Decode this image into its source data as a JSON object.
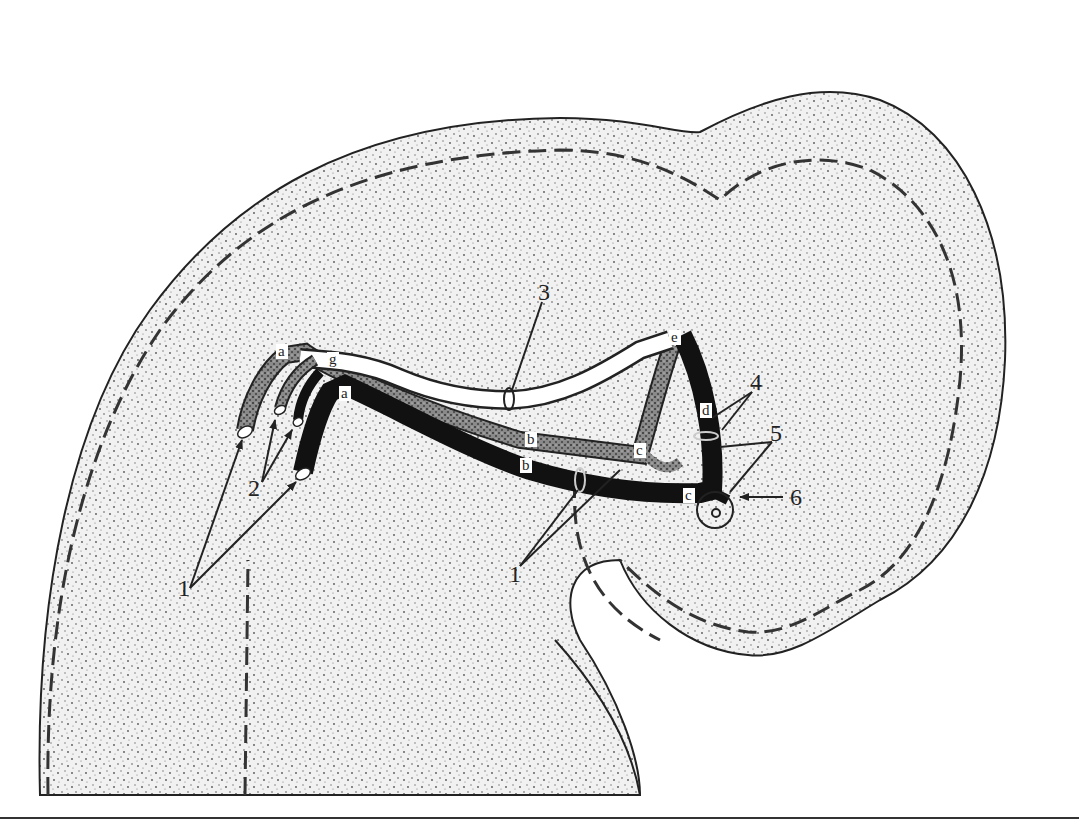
{
  "figure": {
    "type": "anatomical-diagram",
    "colors": {
      "background": "#ffffff",
      "organ_fill": "#e9e9e9",
      "outline": "#222222",
      "black_vessel": "#111111",
      "hatched_duct": "#7a7a7a",
      "white_duct": "#ffffff"
    },
    "number_labels": {
      "n1_left": "1",
      "n1_center": "1",
      "n2": "2",
      "n3": "3",
      "n4": "4",
      "n5": "5",
      "n6": "6"
    },
    "letter_labels": {
      "a_hatched": "a",
      "g": "g",
      "a_black": "a",
      "b_hatched": "b",
      "b_black": "b",
      "c_hatched": "c",
      "c_black": "c",
      "d": "d",
      "e": "e"
    }
  }
}
